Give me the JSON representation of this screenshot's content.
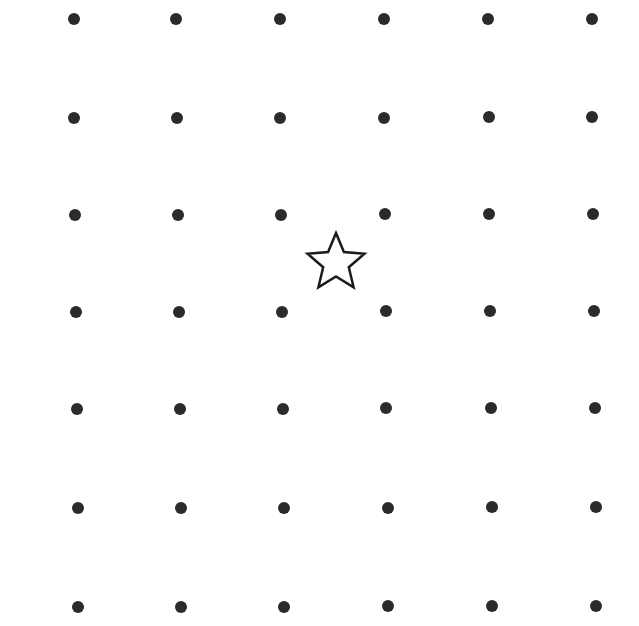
{
  "colors": {
    "background": "#ffffff",
    "dot": "#2b2b2b",
    "star_stroke": "#1a1a1a",
    "star_fill": "#ffffff"
  },
  "grid": {
    "rows": 7,
    "cols": 6,
    "points": [
      [
        [
          74,
          19
        ],
        [
          176,
          19
        ],
        [
          280,
          19
        ],
        [
          384,
          19
        ],
        [
          488,
          19
        ],
        [
          592,
          19
        ]
      ],
      [
        [
          74,
          118
        ],
        [
          177,
          118
        ],
        [
          280,
          118
        ],
        [
          384,
          118
        ],
        [
          489,
          117
        ],
        [
          592,
          117
        ]
      ],
      [
        [
          75,
          215
        ],
        [
          178,
          215
        ],
        [
          281,
          215
        ],
        [
          385,
          214
        ],
        [
          489,
          214
        ],
        [
          593,
          214
        ]
      ],
      [
        [
          76,
          312
        ],
        [
          179,
          312
        ],
        [
          282,
          312
        ],
        [
          386,
          311
        ],
        [
          490,
          311
        ],
        [
          594,
          311
        ]
      ],
      [
        [
          77,
          409
        ],
        [
          180,
          409
        ],
        [
          283,
          409
        ],
        [
          386,
          408
        ],
        [
          491,
          408
        ],
        [
          595,
          408
        ]
      ],
      [
        [
          78,
          508
        ],
        [
          181,
          508
        ],
        [
          284,
          508
        ],
        [
          388,
          508
        ],
        [
          492,
          507
        ],
        [
          596,
          507
        ]
      ],
      [
        [
          78,
          607
        ],
        [
          181,
          607
        ],
        [
          284,
          607
        ],
        [
          388,
          606
        ],
        [
          492,
          606
        ],
        [
          596,
          606
        ]
      ]
    ]
  },
  "star": {
    "cx": 336,
    "cy": 263,
    "size": 64,
    "symbol": "star-outline"
  }
}
